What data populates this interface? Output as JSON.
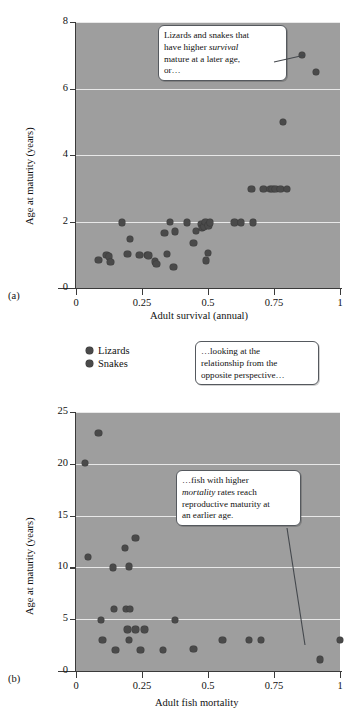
{
  "figure": {
    "panel_a_letter": "(a)",
    "panel_b_letter": "(b)"
  },
  "legend": {
    "items": [
      {
        "label": "Lizards",
        "color": "#4a4a4a"
      },
      {
        "label": "Snakes",
        "color": "#4a4a4a"
      }
    ]
  },
  "callouts": {
    "top": {
      "line1": "Lizards and snakes that",
      "line2_pre": "have higher ",
      "line2_em": "survival",
      "line3": "mature at a later age,",
      "line4": "or…"
    },
    "middle": {
      "line1": "…looking at the",
      "line2": "relationship from the",
      "line3": "opposite perspective…"
    },
    "bottom": {
      "line1": "…fish with higher",
      "line2_em": "mortality",
      "line2_post": " rates reach",
      "line3": "reproductive maturity at",
      "line4": "an earlier age."
    }
  },
  "chart_data": [
    {
      "id": "panel-a",
      "type": "scatter",
      "title": "",
      "xlabel": "Adult survival (annual)",
      "ylabel": "Age at maturity (years)",
      "xlim": [
        0,
        1
      ],
      "ylim": [
        0,
        8
      ],
      "xticks": [
        "0",
        "0.25",
        "0.5",
        "0.75",
        "1"
      ],
      "xtick_values": [
        0,
        0.25,
        0.5,
        0.75,
        1
      ],
      "yticks": [
        "0",
        "2",
        "4",
        "6",
        "8"
      ],
      "ytick_values": [
        0,
        2,
        4,
        6,
        8
      ],
      "grid": "horizontal",
      "legend_position": "below-plot-left",
      "series": [
        {
          "name": "Lizards and snakes",
          "color": "#4a4a4a",
          "points": [
            [
              0.085,
              0.85
            ],
            [
              0.115,
              1.0
            ],
            [
              0.125,
              0.95
            ],
            [
              0.13,
              0.78
            ],
            [
              0.175,
              1.97
            ],
            [
              0.195,
              1.02
            ],
            [
              0.205,
              1.48
            ],
            [
              0.24,
              1.0
            ],
            [
              0.27,
              1.0
            ],
            [
              0.275,
              0.98
            ],
            [
              0.3,
              0.8
            ],
            [
              0.305,
              0.72
            ],
            [
              0.335,
              1.65
            ],
            [
              0.345,
              1.03
            ],
            [
              0.355,
              1.98
            ],
            [
              0.37,
              0.63
            ],
            [
              0.375,
              1.7
            ],
            [
              0.42,
              1.97
            ],
            [
              0.445,
              1.35
            ],
            [
              0.455,
              1.72
            ],
            [
              0.475,
              1.92
            ],
            [
              0.478,
              1.8
            ],
            [
              0.485,
              1.85
            ],
            [
              0.49,
              1.98
            ],
            [
              0.492,
              0.83
            ],
            [
              0.5,
              1.05
            ],
            [
              0.502,
              1.88
            ],
            [
              0.508,
              1.97
            ],
            [
              0.6,
              1.97
            ],
            [
              0.625,
              1.97
            ],
            [
              0.665,
              2.98
            ],
            [
              0.67,
              1.97
            ],
            [
              0.71,
              2.98
            ],
            [
              0.735,
              2.98
            ],
            [
              0.745,
              2.98
            ],
            [
              0.755,
              2.98
            ],
            [
              0.775,
              2.98
            ],
            [
              0.785,
              5.0
            ],
            [
              0.8,
              2.98
            ],
            [
              0.855,
              7.0
            ],
            [
              0.91,
              6.5
            ]
          ]
        }
      ]
    },
    {
      "id": "panel-b",
      "type": "scatter",
      "title": "",
      "xlabel": "Adult fish mortality",
      "ylabel": "Age at maturity (years)",
      "xlim": [
        0,
        1
      ],
      "ylim": [
        0,
        25
      ],
      "xticks": [
        "0",
        "0.25",
        "0.5",
        "0.75",
        "1"
      ],
      "xtick_values": [
        0,
        0.25,
        0.5,
        0.75,
        1
      ],
      "yticks": [
        "0",
        "5",
        "10",
        "15",
        "20",
        "25"
      ],
      "ytick_values": [
        0,
        5,
        10,
        15,
        20,
        25
      ],
      "grid": "horizontal",
      "legend_position": "none",
      "series": [
        {
          "name": "Fish",
          "color": "#4a4a4a",
          "points": [
            [
              0.035,
              20.1
            ],
            [
              0.085,
              23.0
            ],
            [
              0.045,
              11.0
            ],
            [
              0.095,
              4.9
            ],
            [
              0.1,
              3.0
            ],
            [
              0.14,
              10.0
            ],
            [
              0.145,
              6.0
            ],
            [
              0.15,
              2.0
            ],
            [
              0.185,
              11.9
            ],
            [
              0.19,
              6.0
            ],
            [
              0.205,
              6.0
            ],
            [
              0.2,
              10.1
            ],
            [
              0.195,
              4.0
            ],
            [
              0.2,
              3.0
            ],
            [
              0.225,
              12.85
            ],
            [
              0.225,
              4.0
            ],
            [
              0.245,
              2.0
            ],
            [
              0.26,
              4.0
            ],
            [
              0.33,
              2.0
            ],
            [
              0.375,
              4.9
            ],
            [
              0.445,
              2.1
            ],
            [
              0.555,
              3.0
            ],
            [
              0.655,
              3.0
            ],
            [
              0.7,
              3.0
            ],
            [
              0.925,
              1.1
            ],
            [
              1.0,
              3.0
            ]
          ]
        }
      ]
    }
  ]
}
